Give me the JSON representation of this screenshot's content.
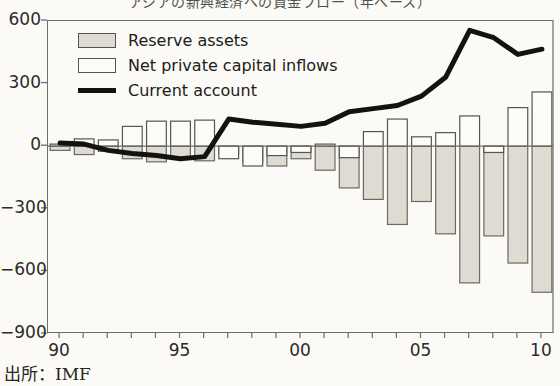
{
  "chart_data": {
    "type": "bar",
    "title": "アジアの新興経済への資金フロー（年ベース）",
    "xlabel": "",
    "ylabel": "",
    "ylim": [
      -900,
      600
    ],
    "xlim": [
      1989.5,
      2010.5
    ],
    "grid": false,
    "legend_position": "top-left",
    "x": [
      1990,
      1991,
      1992,
      1993,
      1994,
      1995,
      1996,
      1997,
      1998,
      1999,
      2000,
      2001,
      2002,
      2003,
      2004,
      2005,
      2006,
      2007,
      2008,
      2009,
      2010
    ],
    "categories": [
      "90",
      "91",
      "92",
      "93",
      "94",
      "95",
      "96",
      "97",
      "98",
      "99",
      "00",
      "01",
      "02",
      "03",
      "04",
      "05",
      "06",
      "07",
      "08",
      "09",
      "10"
    ],
    "x_tick_labels": [
      "90",
      "95",
      "00",
      "05",
      "10"
    ],
    "x_tick_values": [
      1990,
      1995,
      2000,
      2005,
      2010
    ],
    "y_tick_labels": [
      "600",
      "300",
      "0",
      "−300",
      "−600",
      "−900"
    ],
    "y_tick_values": [
      600,
      300,
      0,
      -300,
      -600,
      -900
    ],
    "series": [
      {
        "name": "Net private capital inflows",
        "type": "bar",
        "style": "white",
        "fill": "#fdfcf8",
        "edge": "#55554f",
        "values": [
          10,
          35,
          30,
          95,
          120,
          120,
          125,
          -60,
          -95,
          -45,
          -30,
          10,
          -55,
          70,
          130,
          45,
          65,
          145,
          -30,
          185,
          260
        ]
      },
      {
        "name": "Reserve assets",
        "type": "bar",
        "style": "shaded",
        "fill": "#dedcd2",
        "edge": "#6a6a62",
        "values": [
          -20,
          -40,
          -25,
          -60,
          -75,
          -55,
          -70,
          -35,
          -75,
          -95,
          -60,
          -115,
          -200,
          -255,
          -375,
          -265,
          -420,
          -655,
          -430,
          -560,
          -700
        ]
      },
      {
        "name": "Current account",
        "type": "line",
        "style": "thick-black-line",
        "color": "#121210",
        "values": [
          15,
          10,
          -20,
          -35,
          -45,
          -60,
          -50,
          130,
          115,
          105,
          95,
          110,
          165,
          180,
          195,
          240,
          330,
          555,
          520,
          440,
          465
        ]
      }
    ],
    "legend": [
      {
        "label": "Reserve assets",
        "marker": "shaded-box"
      },
      {
        "label": "Net private capital inflows",
        "marker": "white-box"
      },
      {
        "label": "Current account",
        "marker": "black-line"
      }
    ]
  },
  "source": {
    "text": "出所：IMF"
  }
}
